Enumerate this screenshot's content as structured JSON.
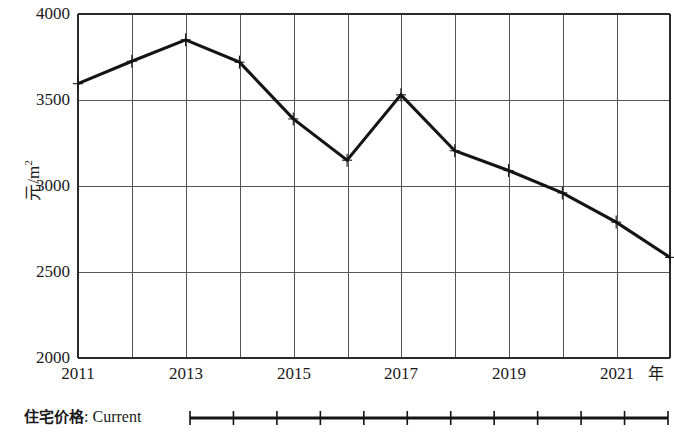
{
  "chart_data": {
    "type": "line",
    "title": "",
    "subtitle": "",
    "xlabel": "年",
    "ylabel": "元/m²",
    "x": [
      2011,
      2012,
      2013,
      2014,
      2015,
      2016,
      2017,
      2018,
      2019,
      2020,
      2021,
      2022
    ],
    "xtick_labels": [
      "2011",
      "2013",
      "2015",
      "2017",
      "2019",
      "2021"
    ],
    "xtick_values": [
      2011,
      2013,
      2015,
      2017,
      2019,
      2021
    ],
    "xlim": [
      2011,
      2022
    ],
    "ytick_labels": [
      "2000",
      "2500",
      "3000",
      "3500",
      "4000"
    ],
    "ytick_values": [
      2000,
      2500,
      3000,
      3500,
      4000
    ],
    "ylim": [
      2000,
      4000
    ],
    "grid": true,
    "grid_color": "#555555",
    "series": [
      {
        "name": "住宅价格: Current",
        "color": "#141414",
        "marker": "plus",
        "values": [
          3595,
          3725,
          3850,
          3720,
          3390,
          3150,
          3530,
          3205,
          3090,
          2960,
          2790,
          2585
        ]
      }
    ],
    "legend_position": "bottom-left",
    "annotations": []
  },
  "axes": {
    "y_unit_label": "元/m",
    "y_unit_exponent": "2",
    "x_unit_label": "年"
  },
  "legend": {
    "entries": [
      {
        "label_cjk": "住宅价格",
        "label_separator": ": ",
        "label_latin": "Current",
        "marker": "plus-line"
      }
    ]
  }
}
